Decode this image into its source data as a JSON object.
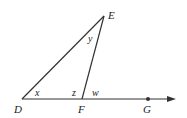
{
  "diagram": {
    "type": "geometry-triangle-exterior-angle",
    "colors": {
      "stroke": "#333333",
      "text": "#222222",
      "background": "#ffffff"
    },
    "points": {
      "D": {
        "label": "D",
        "x": 22,
        "y": 99
      },
      "F": {
        "label": "F",
        "x": 82,
        "y": 99
      },
      "E": {
        "label": "E",
        "x": 104,
        "y": 16
      },
      "G": {
        "label": "G",
        "x": 148,
        "y": 99
      }
    },
    "segments": [
      {
        "from": "D",
        "to": "E"
      },
      {
        "from": "F",
        "to": "E"
      }
    ],
    "ray": {
      "from": "D",
      "through": [
        "F",
        "G"
      ],
      "arrow_tip_x": 175
    },
    "angles": {
      "x": {
        "label": "x",
        "at": "D",
        "description": "angle EDF"
      },
      "y": {
        "label": "y",
        "at": "E",
        "description": "angle DEF"
      },
      "z": {
        "label": "z",
        "at": "F",
        "description": "angle DFE (interior)"
      },
      "w": {
        "label": "w",
        "at": "F",
        "description": "angle EFG (exterior)"
      }
    }
  }
}
